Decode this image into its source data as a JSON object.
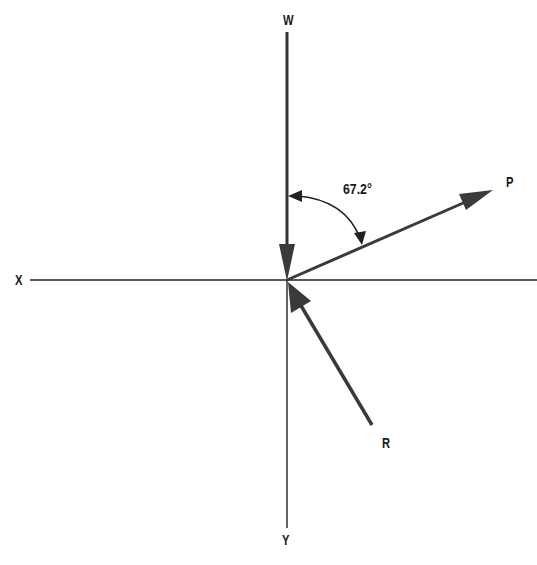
{
  "diagram": {
    "type": "force-vector-diagram",
    "axes": {
      "x_label": "X",
      "y_label": "Y"
    },
    "vectors": [
      {
        "name": "W",
        "label": "W",
        "direction": "down along vertical axis toward origin"
      },
      {
        "name": "P",
        "label": "P",
        "direction": "from origin up-right"
      },
      {
        "name": "R",
        "label": "R",
        "direction": "from lower-right toward origin"
      }
    ],
    "angle": {
      "label": "67.2°",
      "between": [
        "W",
        "P"
      ]
    },
    "colors": {
      "line": "#222222",
      "vector": "#3a3a3a",
      "background": "#ffffff"
    }
  }
}
